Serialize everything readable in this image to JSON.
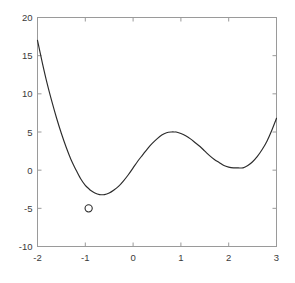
{
  "chart_data": {
    "type": "line",
    "title": "",
    "xlabel": "",
    "ylabel": "",
    "xlim": [
      -2,
      3
    ],
    "ylim": [
      -10,
      20
    ],
    "grid": false,
    "legend": null,
    "xticks": [
      -2,
      -1,
      0,
      1,
      2,
      3
    ],
    "xtick_labels": [
      "-2",
      "-1",
      "0",
      "1",
      "2",
      "3"
    ],
    "yticks": [
      -10,
      -5,
      0,
      5,
      10,
      15,
      20
    ],
    "ytick_labels": [
      "-10",
      "-5",
      "0",
      "5",
      "10",
      "15",
      "20"
    ],
    "series": [
      {
        "name": "curve",
        "color": "#2b2b2b",
        "style": "solid",
        "x": [
          -2.0,
          -1.9,
          -1.8,
          -1.7,
          -1.6,
          -1.5,
          -1.4,
          -1.3,
          -1.2,
          -1.1,
          -1.0,
          -0.93,
          -0.9,
          -0.8,
          -0.7,
          -0.6,
          -0.5,
          -0.4,
          -0.3,
          -0.2,
          -0.1,
          0.0,
          0.1,
          0.2,
          0.3,
          0.4,
          0.5,
          0.6,
          0.7,
          0.8,
          0.88,
          0.9,
          1.0,
          1.1,
          1.2,
          1.3,
          1.4,
          1.5,
          1.6,
          1.7,
          1.8,
          1.9,
          2.0,
          2.1,
          2.2,
          2.3,
          2.4,
          2.5,
          2.6,
          2.7,
          2.8,
          2.9,
          3.0
        ],
        "y": [
          17.0,
          14.1,
          11.4,
          9.0,
          6.8,
          4.8,
          3.0,
          1.4,
          0.1,
          -1.1,
          -2.0,
          -2.4,
          -2.6,
          -3.0,
          -3.2,
          -3.2,
          -3.0,
          -2.6,
          -2.1,
          -1.4,
          -0.6,
          0.3,
          1.2,
          2.0,
          2.8,
          3.5,
          4.1,
          4.6,
          4.9,
          5.0,
          5.0,
          5.0,
          4.8,
          4.5,
          4.1,
          3.6,
          3.1,
          2.5,
          1.9,
          1.4,
          1.0,
          0.6,
          0.4,
          0.3,
          0.3,
          0.3,
          0.6,
          1.1,
          1.8,
          2.7,
          3.8,
          5.2,
          6.8
        ]
      }
    ],
    "markers": [
      {
        "name": "local-minimum-marker",
        "shape": "circle",
        "x": -0.93,
        "y": -5.0,
        "label": ""
      }
    ],
    "axes_color": "#9a9a9a",
    "background": "#ffffff"
  }
}
